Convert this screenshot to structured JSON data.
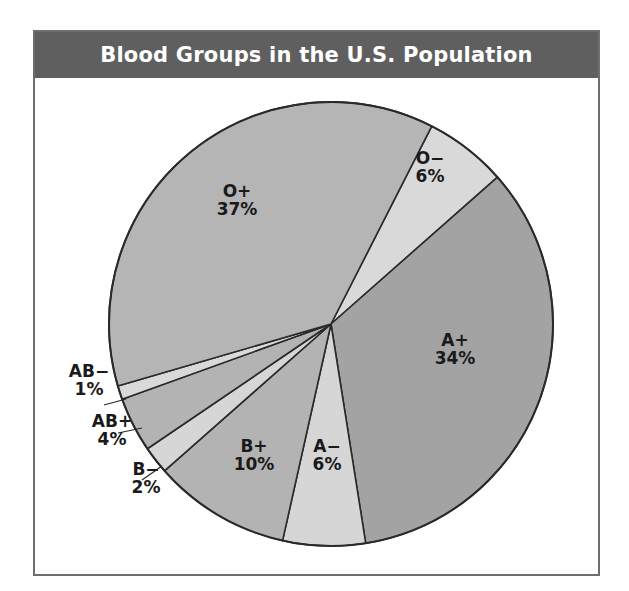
{
  "chart_data": {
    "type": "pie",
    "title": "Blood Groups in the U.S. Population",
    "start_angle_deg": 27,
    "direction": "clockwise",
    "slices": [
      {
        "label": "O−",
        "value": 6,
        "pct_label": "6%",
        "color": "#d9d9d9",
        "label_x": 430,
        "label_y": 182,
        "leader": null
      },
      {
        "label": "A+",
        "value": 34,
        "pct_label": "34%",
        "color": "#a3a3a3",
        "label_x": 455,
        "label_y": 364,
        "leader": null
      },
      {
        "label": "A−",
        "value": 6,
        "pct_label": "6%",
        "color": "#d6d6d6",
        "label_x": 327,
        "label_y": 470,
        "leader": null
      },
      {
        "label": "B+",
        "value": 10,
        "pct_label": "10%",
        "color": "#b3b3b3",
        "label_x": 254,
        "label_y": 470,
        "leader": null
      },
      {
        "label": "B−",
        "value": 2,
        "pct_label": "2%",
        "color": "#d6d6d6",
        "label_x": 146,
        "label_y": 493,
        "leader": [
          [
            142,
            480
          ],
          [
            162,
            466
          ]
        ]
      },
      {
        "label": "AB+",
        "value": 4,
        "pct_label": "4%",
        "color": "#b3b3b3",
        "label_x": 112,
        "label_y": 445,
        "leader": [
          [
            118,
            433
          ],
          [
            142,
            428
          ]
        ]
      },
      {
        "label": "AB−",
        "value": 1,
        "pct_label": "1%",
        "color": "#d9d9d9",
        "label_x": 89,
        "label_y": 395,
        "leader": [
          [
            104,
            405
          ],
          [
            126,
            399
          ]
        ]
      },
      {
        "label": "O+",
        "value": 37,
        "pct_label": "37%",
        "color": "#b5b5b5",
        "label_x": 237,
        "label_y": 215,
        "leader": null
      }
    ],
    "legend": "none (inline labels)"
  },
  "header": {
    "title": "Blood Groups in the U.S. Population"
  }
}
